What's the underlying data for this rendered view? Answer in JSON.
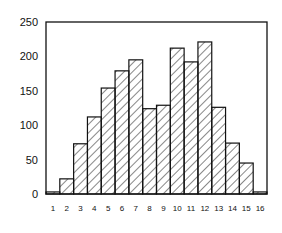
{
  "chart_data": {
    "type": "bar",
    "title": "",
    "xlabel": "",
    "ylabel": "",
    "categories": [
      "1",
      "2",
      "3",
      "4",
      "5",
      "6",
      "7",
      "8",
      "9",
      "10",
      "11",
      "12",
      "13",
      "14",
      "15",
      "16"
    ],
    "values": [
      3,
      22,
      73,
      112,
      154,
      179,
      195,
      124,
      129,
      212,
      192,
      221,
      126,
      74,
      45,
      3
    ],
    "ylim": [
      0,
      250
    ],
    "yticks": [
      0,
      50,
      100,
      150,
      200,
      250
    ],
    "grid": false,
    "legend": null,
    "bar_style": "diagonal-hatch",
    "colors": {
      "stroke": "#111111",
      "fill": "#ffffff"
    }
  }
}
